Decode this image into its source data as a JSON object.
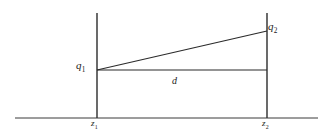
{
  "figure": {
    "type": "physics-geometry-diagram",
    "background_color": "#ffffff",
    "line_color": "#2b2b2b",
    "axis_color": "#3a3a3a"
  },
  "labels": {
    "charge_left": {
      "symbol": "q",
      "subscript": "1"
    },
    "charge_right": {
      "symbol": "q",
      "subscript": "2"
    },
    "distance": {
      "symbol": "d"
    },
    "position_left": {
      "symbol": "z",
      "subscript": "1"
    },
    "position_right": {
      "symbol": "z",
      "subscript": "2"
    }
  },
  "geometry": {
    "baseline": {
      "x1": 15,
      "y1": 118,
      "x2": 318,
      "y2": 118
    },
    "vertical_left": {
      "x1": 97,
      "y1": 13,
      "x2": 97,
      "y2": 118
    },
    "vertical_right": {
      "x1": 267,
      "y1": 13,
      "x2": 267,
      "y2": 118
    },
    "slanted_line": {
      "x1": 97,
      "y1": 70,
      "x2": 267,
      "y2": 31
    },
    "horizontal_line": {
      "x1": 97,
      "y1": 70,
      "x2": 267,
      "y2": 70
    }
  }
}
